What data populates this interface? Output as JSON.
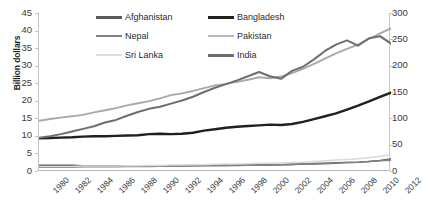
{
  "chart_data": {
    "type": "line",
    "title": "",
    "xlabel": "",
    "ylabel": "Billion dollars",
    "y2label": "",
    "grid": false,
    "legend_position": "top-center",
    "x": [
      1980,
      1981,
      1982,
      1983,
      1984,
      1985,
      1986,
      1987,
      1988,
      1989,
      1990,
      1991,
      1992,
      1993,
      1994,
      1995,
      1996,
      1997,
      1998,
      1999,
      2000,
      2001,
      2002,
      2003,
      2004,
      2005,
      2006,
      2007,
      2008,
      2009,
      2010,
      2011,
      2012
    ],
    "xticklabels": [
      "1980",
      "1982",
      "1984",
      "1986",
      "1988",
      "1990",
      "1992",
      "1994",
      "1996",
      "1998",
      "2000",
      "2002",
      "2004",
      "2006",
      "2008",
      "2010",
      "2012"
    ],
    "ylim": [
      0,
      45
    ],
    "yticks": [
      0,
      5,
      10,
      15,
      20,
      25,
      30,
      35,
      40,
      45
    ],
    "y2lim": [
      0,
      300
    ],
    "y2ticks": [
      0,
      50,
      100,
      150,
      200,
      250,
      300
    ],
    "series": [
      {
        "name": "Afghanistan",
        "axis": "left",
        "color": "#58595b",
        "width": 1.6,
        "values": [
          1.6,
          1.6,
          1.6,
          1.6,
          1.5,
          1.5,
          1.5,
          1.5,
          1.5,
          1.5,
          1.5,
          1.5,
          1.5,
          1.5,
          1.5,
          1.6,
          1.6,
          1.6,
          1.6,
          1.7,
          1.7,
          1.7,
          1.8,
          1.9,
          2.0,
          2.1,
          2.2,
          2.3,
          2.4,
          2.5,
          2.7,
          3.0,
          3.4
        ]
      },
      {
        "name": "Bangladesh",
        "axis": "left",
        "color": "#231f20",
        "width": 2.4,
        "values": [
          9.3,
          9.4,
          9.5,
          9.6,
          9.8,
          9.9,
          9.9,
          10.0,
          10.1,
          10.2,
          10.5,
          10.6,
          10.5,
          10.6,
          10.9,
          11.5,
          11.9,
          12.3,
          12.6,
          12.8,
          13.0,
          13.2,
          13.1,
          13.4,
          14.0,
          14.8,
          15.6,
          16.4,
          17.5,
          18.6,
          19.8,
          21.1,
          22.3
        ]
      },
      {
        "name": "Nepal",
        "axis": "left",
        "color": "#808285",
        "width": 1.6,
        "values": [
          1.1,
          1.1,
          1.1,
          1.1,
          1.2,
          1.2,
          1.2,
          1.2,
          1.3,
          1.3,
          1.3,
          1.4,
          1.4,
          1.4,
          1.5,
          1.5,
          1.6,
          1.6,
          1.7,
          1.7,
          1.8,
          1.8,
          1.8,
          1.9,
          2.0,
          2.0,
          2.1,
          2.2,
          2.4,
          2.5,
          2.7,
          2.9,
          3.1
        ]
      },
      {
        "name": "Pakistan",
        "axis": "left",
        "color": "#a7a9ac",
        "width": 1.9,
        "values": [
          14.3,
          14.8,
          15.2,
          15.6,
          16.0,
          16.7,
          17.3,
          17.9,
          18.7,
          19.3,
          19.9,
          20.7,
          21.6,
          22.1,
          22.8,
          23.6,
          24.4,
          24.8,
          25.4,
          26.0,
          26.7,
          26.4,
          26.9,
          27.9,
          29.1,
          30.5,
          32.0,
          33.5,
          34.8,
          36.0,
          37.6,
          39.2,
          40.6
        ]
      },
      {
        "name": "Sri Lanka",
        "axis": "left",
        "color": "#d9dadb",
        "width": 1.5,
        "values": [
          1.3,
          1.3,
          1.3,
          1.3,
          1.4,
          1.4,
          1.4,
          1.4,
          1.5,
          1.5,
          1.6,
          1.6,
          1.7,
          1.7,
          1.8,
          1.8,
          1.9,
          2.0,
          2.0,
          2.1,
          2.2,
          2.2,
          2.3,
          2.4,
          2.5,
          2.7,
          2.9,
          3.1,
          3.3,
          3.5,
          3.8,
          4.2,
          4.6
        ]
      },
      {
        "name": "India",
        "axis": "right",
        "color": "#6d6e71",
        "width": 2.0,
        "values": [
          63,
          66,
          70,
          75,
          80,
          85,
          92,
          97,
          105,
          112,
          118,
          122,
          128,
          134,
          141,
          150,
          158,
          165,
          172,
          180,
          188,
          180,
          175,
          190,
          198,
          212,
          228,
          240,
          248,
          238,
          252,
          256,
          242
        ]
      }
    ]
  },
  "axes": {
    "left_ticklabels": [
      "45",
      "40",
      "35",
      "30",
      "25",
      "20",
      "15",
      "10",
      "5",
      "0"
    ],
    "right_ticklabels": [
      "300",
      "250",
      "200",
      "150",
      "100",
      "50",
      "0"
    ],
    "ylabel": "Billion dollars"
  },
  "legend": {
    "items": [
      {
        "label": "Afghanistan",
        "color": "#58595b",
        "width": 3.0
      },
      {
        "label": "Bangladesh",
        "color": "#231f20",
        "width": 3.4
      },
      {
        "label": "Nepal",
        "color": "#808285",
        "width": 2.8
      },
      {
        "label": "Pakistan",
        "color": "#b5b7b9",
        "width": 2.6
      },
      {
        "label": "Sri Lanka",
        "color": "#dddede",
        "width": 2.4
      },
      {
        "label": "India",
        "color": "#6d6e71",
        "width": 3.0
      }
    ]
  }
}
